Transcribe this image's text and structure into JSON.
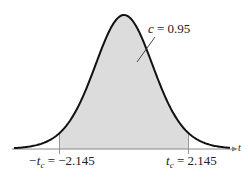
{
  "chart_data": {
    "type": "area",
    "title": "",
    "xlabel": "t",
    "ylabel": "",
    "grid": false,
    "legend": null,
    "critical_values": {
      "left": -2.145,
      "right": 2.145
    },
    "shaded_region": {
      "from": -2.145,
      "to": 2.145,
      "area": 0.95,
      "color": "#dcdcdc"
    },
    "annotations": [
      {
        "text": "c = 0.95",
        "variable": "c",
        "value": "0.95"
      },
      {
        "text": "−t_c = −2.145",
        "variable": "−t_c",
        "value": "−2.145"
      },
      {
        "text": "t_c = 2.145",
        "variable": "t_c",
        "value": "2.145"
      }
    ],
    "curve_color": "#111111",
    "axis_color": "#888888"
  },
  "labels": {
    "axis_var": "t",
    "c_var": "c",
    "c_eq": " = 0.95",
    "left_prefix": "−t",
    "left_sub": "c",
    "left_eq": " = −2.145",
    "right_prefix": "t",
    "right_sub": "c",
    "right_eq": " = 2.145"
  }
}
